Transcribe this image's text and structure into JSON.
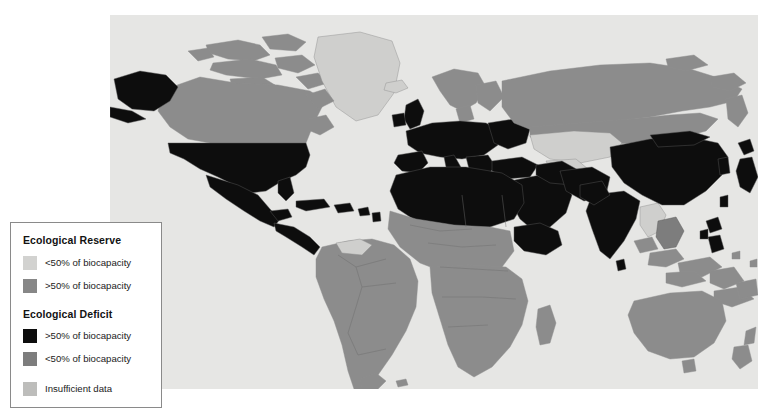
{
  "map": {
    "title": "World Ecological Reserve and Deficit Map",
    "ocean_color": "#e6e6e4",
    "projection": "equirectangular",
    "categories": [
      {
        "key": "reserve_lo",
        "group": "Ecological Reserve",
        "label": "<50% of biocapacity",
        "color": "#d2d2d0"
      },
      {
        "key": "reserve_hi",
        "group": "Ecological Reserve",
        "label": ">50% of biocapacity",
        "color": "#878787"
      },
      {
        "key": "deficit_hi",
        "group": "Ecological Deficit",
        "label": ">50% of biocapacity",
        "color": "#0d0d0d"
      },
      {
        "key": "deficit_lo",
        "group": "Ecological Deficit",
        "label": "<50% of biocapacity",
        "color": "#7d7d7d"
      },
      {
        "key": "nodata",
        "group": "",
        "label": "Insufficient data",
        "color": "#bdbdbb"
      }
    ],
    "regions": [
      {
        "name": "Greenland",
        "class": "c-reserve-lo"
      },
      {
        "name": "Canada",
        "class": "c-reserve-hi"
      },
      {
        "name": "Alaska",
        "class": "c-deficit-hi"
      },
      {
        "name": "United States",
        "class": "c-deficit-hi"
      },
      {
        "name": "Mexico",
        "class": "c-deficit-hi"
      },
      {
        "name": "Central America",
        "class": "c-deficit-hi"
      },
      {
        "name": "Caribbean",
        "class": "c-deficit-hi"
      },
      {
        "name": "South America",
        "class": "c-reserve-hi"
      },
      {
        "name": "Western Europe",
        "class": "c-deficit-hi"
      },
      {
        "name": "United Kingdom",
        "class": "c-deficit-hi"
      },
      {
        "name": "Scandinavia",
        "class": "c-reserve-hi"
      },
      {
        "name": "Russia",
        "class": "c-reserve-hi"
      },
      {
        "name": "Kazakhstan",
        "class": "c-reserve-lo"
      },
      {
        "name": "North Africa",
        "class": "c-deficit-hi"
      },
      {
        "name": "Sub-Saharan Africa",
        "class": "c-reserve-hi"
      },
      {
        "name": "Ethiopia",
        "class": "c-deficit-hi"
      },
      {
        "name": "Middle East",
        "class": "c-deficit-hi"
      },
      {
        "name": "India",
        "class": "c-deficit-hi"
      },
      {
        "name": "China",
        "class": "c-deficit-hi"
      },
      {
        "name": "Japan",
        "class": "c-deficit-hi"
      },
      {
        "name": "Philippines",
        "class": "c-deficit-hi"
      },
      {
        "name": "Indonesia",
        "class": "c-reserve-hi"
      },
      {
        "name": "Australia",
        "class": "c-reserve-hi"
      },
      {
        "name": "New Zealand",
        "class": "c-reserve-hi"
      }
    ]
  },
  "legend": {
    "reserve_heading": "Ecological Reserve",
    "deficit_heading": "Ecological Deficit",
    "rows": [
      {
        "label": "<50% of biocapacity",
        "swatch": "sw-reserve-lo"
      },
      {
        "label": ">50% of biocapacity",
        "swatch": "sw-reserve-hi"
      },
      {
        "label": ">50% of biocapacity",
        "swatch": "sw-deficit-hi"
      },
      {
        "label": "<50% of biocapacity",
        "swatch": "sw-deficit-lo"
      },
      {
        "label": "Insufficient data",
        "swatch": "sw-nodata"
      }
    ]
  }
}
